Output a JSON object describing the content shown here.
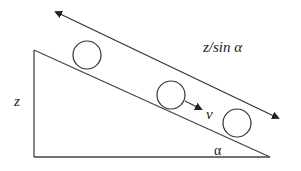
{
  "diagram": {
    "labels": {
      "distance": "z/sin α",
      "velocity": "v",
      "angle": "α",
      "height": "z"
    },
    "colors": {
      "stroke": "#333333",
      "background": "#ffffff"
    },
    "elements": {
      "incline_triangle": "right triangle with height z and angle α at base right",
      "balls": 3,
      "double_arrow": "parallel to incline, labeled z/sin α",
      "velocity_arrow": "short arrow from middle ball labeled v"
    }
  }
}
